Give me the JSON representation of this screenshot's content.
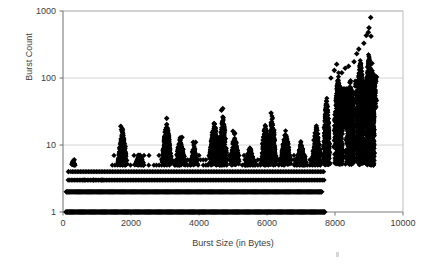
{
  "chart_data": {
    "type": "scatter",
    "title": "",
    "xlabel": "Burst Size (in Bytes)",
    "ylabel": "Burst Count",
    "xlim": [
      0,
      10000
    ],
    "ylim": [
      1,
      1000
    ],
    "yscale": "log",
    "xscale": "linear",
    "grid": true,
    "grid_axis": "y",
    "legend": "none",
    "marker": "filled-diamond",
    "marker_color": "#000000",
    "marker_size_px": 2.6,
    "xticks": [
      0,
      2000,
      4000,
      6000,
      8000,
      10000
    ],
    "xtick_labels": [
      "0",
      "2000",
      "4000",
      "6000",
      "8000",
      "10000"
    ],
    "yticks": [
      1,
      10,
      100,
      1000
    ],
    "ytick_labels": [
      "1",
      "10",
      "100",
      "1000"
    ],
    "bands": [
      {
        "count": 1,
        "x_start": 90,
        "x_end": 7700,
        "density": "solid"
      },
      {
        "count": 2,
        "x_start": 100,
        "x_end": 7620,
        "density": "solid"
      },
      {
        "count": 3,
        "x_start": 150,
        "x_end": 7680,
        "density": "heavy"
      },
      {
        "count": 4,
        "x_start": 230,
        "x_end": 7680,
        "density": "heavy"
      },
      {
        "count": 5,
        "x_start": 1450,
        "x_end": 7680,
        "density": "medium"
      },
      {
        "count": 6,
        "x_start": 2900,
        "x_end": 7680,
        "density": "medium"
      },
      {
        "count": 7,
        "x_start": 1500,
        "x_end": 7680,
        "density": "light"
      }
    ],
    "clusters": [
      {
        "x_center": 300,
        "x_width": 160,
        "peak": 6,
        "n": 30
      },
      {
        "x_center": 1750,
        "x_width": 330,
        "peak": 19,
        "n": 320
      },
      {
        "x_center": 2250,
        "x_width": 330,
        "peak": 8,
        "n": 140
      },
      {
        "x_center": 3050,
        "x_width": 330,
        "peak": 25,
        "n": 330
      },
      {
        "x_center": 3450,
        "x_width": 380,
        "peak": 14,
        "n": 240
      },
      {
        "x_center": 3850,
        "x_width": 260,
        "peak": 11,
        "n": 120
      },
      {
        "x_center": 4450,
        "x_width": 380,
        "peak": 24,
        "n": 380
      },
      {
        "x_center": 4700,
        "x_width": 300,
        "peak": 35,
        "n": 230
      },
      {
        "x_center": 5050,
        "x_width": 330,
        "peak": 16,
        "n": 210
      },
      {
        "x_center": 5500,
        "x_width": 380,
        "peak": 10,
        "n": 200
      },
      {
        "x_center": 5950,
        "x_width": 300,
        "peak": 22,
        "n": 300
      },
      {
        "x_center": 6150,
        "x_width": 300,
        "peak": 30,
        "n": 320
      },
      {
        "x_center": 6550,
        "x_width": 380,
        "peak": 18,
        "n": 260
      },
      {
        "x_center": 7000,
        "x_width": 400,
        "peak": 12,
        "n": 240
      },
      {
        "x_center": 7450,
        "x_width": 330,
        "peak": 23,
        "n": 300
      },
      {
        "x_center": 7750,
        "x_width": 230,
        "peak": 60,
        "n": 420
      },
      {
        "x_center": 8100,
        "x_width": 330,
        "peak": 130,
        "n": 620
      },
      {
        "x_center": 8450,
        "x_width": 330,
        "peak": 110,
        "n": 520
      },
      {
        "x_center": 8750,
        "x_width": 300,
        "peak": 230,
        "n": 640
      },
      {
        "x_center": 9000,
        "x_width": 260,
        "peak": 300,
        "n": 700
      },
      {
        "x_center": 9100,
        "x_width": 160,
        "peak": 200,
        "n": 420
      }
    ],
    "lower_tail": [
      {
        "x_center": 8350,
        "x_width": 500,
        "low": 18,
        "high": 70,
        "n": 380
      },
      {
        "x_center": 8800,
        "x_width": 500,
        "low": 22,
        "high": 90,
        "n": 420
      },
      {
        "x_center": 9100,
        "x_width": 300,
        "low": 35,
        "high": 110,
        "n": 300
      }
    ],
    "outliers": [
      {
        "x": 9050,
        "y": 800
      },
      {
        "x": 9000,
        "y": 560
      },
      {
        "x": 8980,
        "y": 480
      },
      {
        "x": 8920,
        "y": 430
      },
      {
        "x": 9060,
        "y": 420
      },
      {
        "x": 8850,
        "y": 330
      },
      {
        "x": 8700,
        "y": 270
      },
      {
        "x": 8640,
        "y": 230
      },
      {
        "x": 8560,
        "y": 175
      },
      {
        "x": 8400,
        "y": 150
      },
      {
        "x": 8300,
        "y": 140
      },
      {
        "x": 8200,
        "y": 120
      },
      {
        "x": 8050,
        "y": 160
      },
      {
        "x": 7980,
        "y": 130
      },
      {
        "x": 7880,
        "y": 100
      },
      {
        "x": 4700,
        "y": 35
      },
      {
        "x": 4660,
        "y": 33
      },
      {
        "x": 6120,
        "y": 30
      },
      {
        "x": 3050,
        "y": 25
      },
      {
        "x": 1700,
        "y": 19
      },
      {
        "x": 1720,
        "y": 17
      },
      {
        "x": 5000,
        "y": 16
      },
      {
        "x": 3500,
        "y": 13
      },
      {
        "x": 3830,
        "y": 11
      },
      {
        "x": 3900,
        "y": 11
      },
      {
        "x": 330,
        "y": 6
      },
      {
        "x": 350,
        "y": 5
      },
      {
        "x": 160,
        "y": 4
      },
      {
        "x": 620,
        "y": 3
      },
      {
        "x": 900,
        "y": 3
      },
      {
        "x": 1150,
        "y": 3
      }
    ]
  },
  "axes": {
    "y_label": "Burst Count",
    "x_label": "Burst Size (in Bytes)",
    "y_tick_1000": "1000",
    "y_tick_100": "100",
    "y_tick_10": "10",
    "y_tick_1": "1",
    "x_tick_0": "0",
    "x_tick_2000": "2000",
    "x_tick_4000": "4000",
    "x_tick_6000": "6000",
    "x_tick_8000": "8000",
    "x_tick_10000": "10000",
    "grid_color": "#c9c9c9",
    "frame_color": "#b5b5b5",
    "text_color": "#3d3d3d",
    "marker_color": "#000000",
    "background": "#ffffff"
  },
  "geometry": {
    "plot_left": 63,
    "plot_right": 403,
    "plot_top": 11,
    "plot_bottom": 212
  }
}
